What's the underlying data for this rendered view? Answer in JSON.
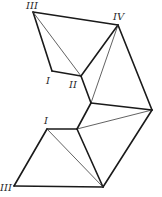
{
  "diagram": {
    "title": "",
    "labels": {
      "top_III": "III",
      "top_IV": "IV",
      "top_I": "I",
      "top_II": "II",
      "bottom_I": "I",
      "bottom_III": "III"
    },
    "vertices": {
      "III_top": [
        33,
        12
      ],
      "IV_top": [
        118,
        25
      ],
      "I_top": [
        52,
        71
      ],
      "II_top": [
        81,
        76
      ],
      "mid": [
        91,
        103
      ],
      "right": [
        152,
        110
      ],
      "lower_mid": [
        77,
        129
      ],
      "I_bottom": [
        47,
        129
      ],
      "III_bottom": [
        14,
        186
      ],
      "bottom": [
        103,
        187
      ]
    },
    "colors": {
      "stroke": "#1a1a1a",
      "background": "#ffffff"
    }
  }
}
